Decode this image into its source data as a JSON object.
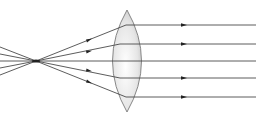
{
  "diagram": {
    "type": "optics-ray-diagram",
    "focal_point": {
      "x": 36,
      "y": 61
    },
    "lens": {
      "type": "biconvex",
      "center_x": 127,
      "top_y": 10,
      "bottom_y": 112,
      "half_width": 15
    },
    "incoming_left_rays_y": [
      44,
      52,
      61,
      70,
      78
    ],
    "parallel_rays_y": [
      25,
      44,
      61,
      78,
      97
    ],
    "arrow_positions": {
      "diverging_x": 89,
      "parallel_x": 184
    },
    "colors": {
      "ray": "#4a4a4a",
      "lens_edge": "#7a7a7a",
      "lens_fill_light": "#ffffff",
      "lens_fill_dark": "#c8c8c8",
      "arrow": "#222222"
    }
  }
}
